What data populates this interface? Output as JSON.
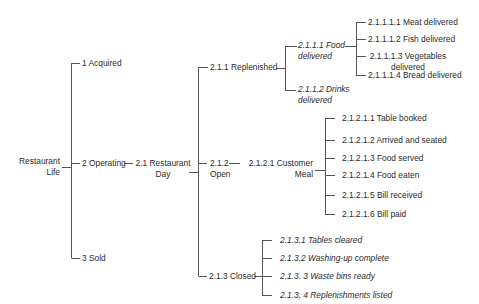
{
  "diagram": {
    "title": "Restaurant Life",
    "root": {
      "label_line1": "Restaurant",
      "label_line2": "Life"
    },
    "level1": [
      {
        "label": "1 Acquired"
      },
      {
        "label": "2 Operating"
      },
      {
        "label": "3 Sold"
      }
    ],
    "restaurant_day": {
      "label_line1": "2.1 Restaurant",
      "label_line2": "Day"
    },
    "replenished": {
      "label": "2.1.1 Replenished",
      "children": [
        {
          "label_line1": "2.1.1.1 Food",
          "label_line2": "delivered",
          "children": [
            {
              "label": "2.1.1.1.1 Meat delivered"
            },
            {
              "label": "2.1.1.1.2 Fish delivered"
            },
            {
              "label_line1": "2.1.1.1.3 Vegetables",
              "label_line2": "delivered"
            },
            {
              "label": "2.1.1.1.4 Bread delivered"
            }
          ]
        },
        {
          "label_line1": "2.1.1.2 Drinks",
          "label_line2": "delivered"
        }
      ]
    },
    "open": {
      "label_line1": "2.1.2",
      "label_line2": "Open",
      "customer_meal": {
        "label_line1": "2.1.2.1 Customer",
        "label_line2": "Meal",
        "children": [
          {
            "label": "2.1.2.1.1 Table booked"
          },
          {
            "label": "2.1.2.1.2 Arrived and seated"
          },
          {
            "label": "2.1.2.1.3 Food served"
          },
          {
            "label": "2.1.2.1.4 Food eaten"
          },
          {
            "label": "2.1.2.1.5 Bill received"
          },
          {
            "label": "2.1.2.1.6 Bill paid"
          }
        ]
      }
    },
    "closed": {
      "label": "2.1.3 Closed",
      "children": [
        {
          "label": "2.1.3.1 Tables cleared"
        },
        {
          "label": "2.1.3.2 Washing-up complete"
        },
        {
          "label": "2.1.3. 3 Waste bins ready"
        },
        {
          "label": "2.1.3. 4 Replenishments listed"
        }
      ]
    },
    "line_color": "#555555",
    "text_color": "#2b2b2b"
  }
}
